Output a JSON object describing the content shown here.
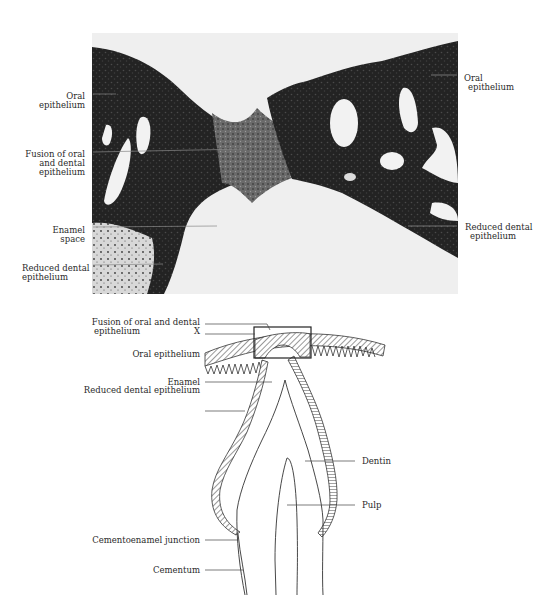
{
  "figure": {
    "panels": [
      {
        "id": "micrograph",
        "type": "histological photomicrograph",
        "labels": {
          "left": [
            {
              "text": "Oral\nepithelium",
              "lines": [
                "Oral",
                "epithelium"
              ]
            },
            {
              "text": "Fusion of oral and dental epithelium",
              "lines": [
                "Fusion of oral",
                "and dental",
                "epithelium"
              ]
            },
            {
              "text": "Enamel space",
              "lines": [
                "Enamel",
                "space"
              ]
            },
            {
              "text": "Reduced dental epithelium",
              "lines": [
                "Reduced dental",
                "epithelium"
              ]
            }
          ],
          "right": [
            {
              "text": "Oral epithelium",
              "lines": [
                "Oral",
                "epithelium"
              ]
            },
            {
              "text": "Reduced dental epithelium",
              "lines": [
                "Reduced dental",
                "epithelium"
              ]
            }
          ]
        }
      },
      {
        "id": "schematic",
        "type": "line drawing of erupting tooth",
        "labels": {
          "left": [
            {
              "text": "Fusion of oral and dental epithelium",
              "lines": [
                "Fusion of oral and dental",
                "epithelium"
              ]
            },
            {
              "text": "X",
              "lines": [
                "X"
              ]
            },
            {
              "text": "Oral epithelium",
              "lines": [
                "Oral epithelium"
              ]
            },
            {
              "text": "Enamel",
              "lines": [
                "Enamel"
              ]
            },
            {
              "text": "Reduced dental epithelium",
              "lines": [
                "Reduced dental epithelium"
              ]
            },
            {
              "text": "Cementoenamel junction",
              "lines": [
                "Cementoenamel junction"
              ]
            },
            {
              "text": "Cementum",
              "lines": [
                "Cementum"
              ]
            }
          ],
          "right": [
            {
              "text": "Dentin",
              "lines": [
                "Dentin"
              ]
            },
            {
              "text": "Pulp",
              "lines": [
                "Pulp"
              ]
            }
          ]
        }
      }
    ]
  },
  "colors": {
    "background": "#ffffff",
    "tissue_dark": "#1c1c1c",
    "tissue_mid": "#4a4a4a",
    "space_light": "#ececec",
    "line": "#333333"
  }
}
